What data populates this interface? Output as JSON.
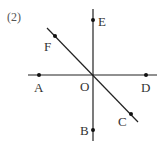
{
  "problem_label": "(2)",
  "colors": {
    "line": "#222222",
    "text": "#333333"
  },
  "intersection": {
    "label": "O",
    "x": 93,
    "y": 75
  },
  "lines": [
    {
      "name": "vertical",
      "x1": 93,
      "y1": 9,
      "x2": 93,
      "y2": 141
    },
    {
      "name": "horizontal",
      "x1": 28,
      "y1": 75,
      "x2": 157,
      "y2": 75
    },
    {
      "name": "diagonal",
      "x1": 47,
      "y1": 28,
      "x2": 138,
      "y2": 122
    }
  ],
  "points": [
    {
      "label": "E",
      "x": 93,
      "y": 20,
      "lx": 98,
      "ly": 26
    },
    {
      "label": "F",
      "x": 55,
      "y": 36,
      "lx": 44,
      "ly": 51
    },
    {
      "label": "A",
      "x": 39,
      "y": 75,
      "lx": 34,
      "ly": 92
    },
    {
      "label": "D",
      "x": 146,
      "y": 75,
      "lx": 141,
      "ly": 92
    },
    {
      "label": "C",
      "x": 131,
      "y": 114,
      "lx": 118,
      "ly": 126
    },
    {
      "label": "B",
      "x": 93,
      "y": 130,
      "lx": 80,
      "ly": 135
    }
  ]
}
